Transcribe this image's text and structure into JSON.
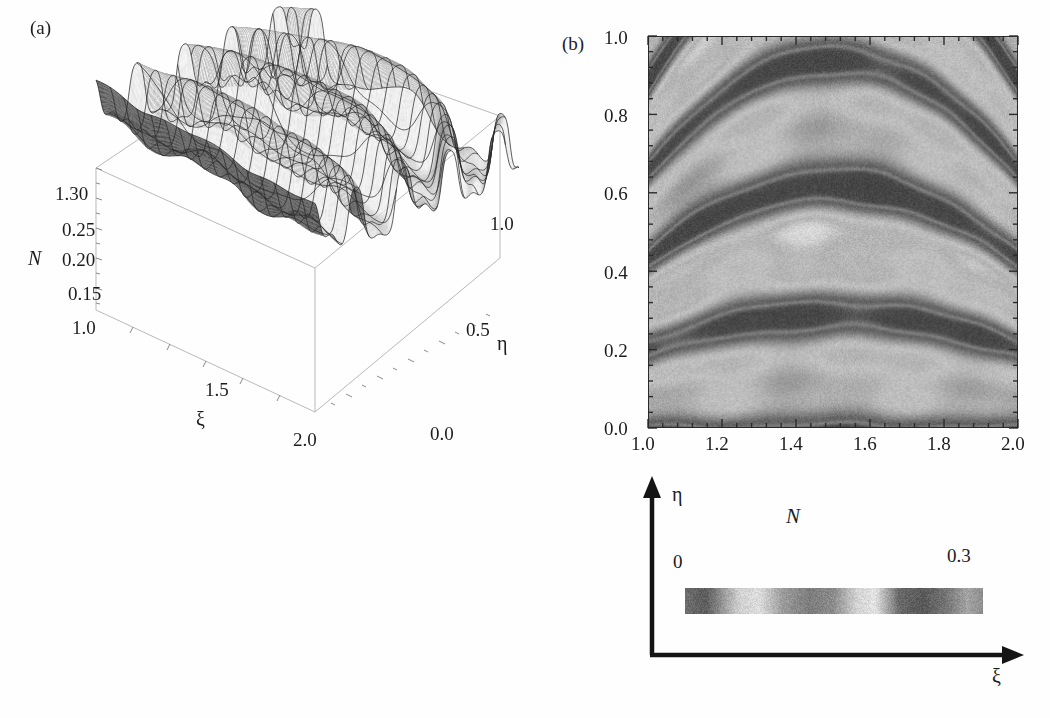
{
  "figure": {
    "panel_a_tag": "(a)",
    "panel_b_tag": "(b)"
  },
  "panel_a": {
    "type": "surface3d",
    "vertical_axis_label": "N",
    "vertical_ticks": [
      "1.30",
      "0.25",
      "0.20",
      "0.15"
    ],
    "xi_axis_label": "ξ",
    "xi_ticks": [
      "1.0",
      "1.5",
      "2.0"
    ],
    "eta_axis_label": "η",
    "eta_ticks": [
      "0.0",
      "0.5",
      "1.0"
    ],
    "mesh": true,
    "shading": "grayscale"
  },
  "panel_b": {
    "type": "density",
    "x_ticks": [
      "1.0",
      "1.2",
      "1.4",
      "1.6",
      "1.8",
      "2.0"
    ],
    "y_ticks": [
      "1.0",
      "0.8",
      "0.6",
      "0.4",
      "0.2",
      "0.0"
    ],
    "xlim": [
      1.0,
      2.0
    ],
    "ylim": [
      0.0,
      1.0
    ],
    "minor_ticks_per_interval": 4,
    "frame": true
  },
  "legend": {
    "title": "N",
    "min_label": "0",
    "max_label": "0.3",
    "eta_label": "η",
    "xi_label": "ξ",
    "axis_color": "#141414"
  },
  "chart_data": {
    "type": "heatmap",
    "title": "",
    "subtitle": "",
    "xlabel": "ξ",
    "ylabel": "η",
    "zlabel": "N",
    "x": [
      1.0,
      1.2,
      1.4,
      1.6,
      1.8,
      2.0
    ],
    "y": [
      0.0,
      0.2,
      0.4,
      0.6,
      0.8,
      1.0
    ],
    "xlim": [
      1.0,
      2.0
    ],
    "ylim": [
      0.0,
      1.0
    ],
    "zlim": [
      0,
      0.3
    ],
    "grid": false,
    "legend_position": "below",
    "colormap": "cyclic-grayscale",
    "panels": [
      {
        "id": "a",
        "tag": "(a)",
        "type": "surface",
        "axes": {
          "xi": {
            "label": "ξ",
            "ticks": [
              1.0,
              1.5,
              2.0
            ],
            "tick_labels": [
              "1.0",
              "1.5",
              "2.0"
            ]
          },
          "eta": {
            "label": "η",
            "ticks": [
              0.0,
              0.5,
              1.0
            ],
            "tick_labels": [
              "0.0",
              "0.5",
              "1.0"
            ]
          },
          "N": {
            "label": "N",
            "ticks": [
              0.15,
              0.2,
              0.25,
              0.3
            ],
            "tick_labels": [
              "0.15",
              "0.20",
              "0.25",
              "1.30"
            ]
          }
        }
      },
      {
        "id": "b",
        "tag": "(b)",
        "type": "density",
        "axes": {
          "x": {
            "label": "ξ",
            "ticks": [
              1.0,
              1.2,
              1.4,
              1.6,
              1.8,
              2.0
            ],
            "tick_labels": [
              "1.0",
              "1.2",
              "1.4",
              "1.6",
              "1.8",
              "2.0"
            ]
          },
          "y": {
            "label": "η",
            "ticks": [
              0.0,
              0.2,
              0.4,
              0.6,
              0.8,
              1.0
            ],
            "tick_labels": [
              "0.0",
              "0.2",
              "0.4",
              "0.6",
              "0.8",
              "1.0"
            ]
          }
        }
      }
    ],
    "bands": [
      {
        "center_eta": 0.94,
        "description": "bright elliptical ring around dark core, spanning xi 1.25-1.75"
      },
      {
        "center_eta": 0.7,
        "description": "bright arc crest over dark band"
      },
      {
        "center_eta": 0.55,
        "description": "broad dark arc band"
      },
      {
        "center_eta": 0.45,
        "description": "bright arc"
      },
      {
        "center_eta": 0.27,
        "description": "bright arc"
      },
      {
        "center_eta": 0.18,
        "description": "dark arc"
      },
      {
        "center_eta": 0.12,
        "description": "bright arc"
      },
      {
        "center_eta": 0.05,
        "description": "dark lobes near bottom"
      }
    ],
    "colorbar_stops": [
      {
        "pos": 0.0,
        "value": 0.0,
        "gray": "#6d6d6d"
      },
      {
        "pos": 0.07,
        "value": 0.021,
        "gray": "#5e5e5e"
      },
      {
        "pos": 0.18,
        "value": 0.054,
        "gray": "#cfcfcf"
      },
      {
        "pos": 0.25,
        "value": 0.075,
        "gray": "#dedede"
      },
      {
        "pos": 0.33,
        "value": 0.099,
        "gray": "#9a9a9a"
      },
      {
        "pos": 0.42,
        "value": 0.126,
        "gray": "#7d7d7d"
      },
      {
        "pos": 0.5,
        "value": 0.15,
        "gray": "#8d8d8d"
      },
      {
        "pos": 0.58,
        "value": 0.174,
        "gray": "#d5d5d5"
      },
      {
        "pos": 0.64,
        "value": 0.192,
        "gray": "#e2e2e2"
      },
      {
        "pos": 0.72,
        "value": 0.216,
        "gray": "#6a6a6a"
      },
      {
        "pos": 0.8,
        "value": 0.24,
        "gray": "#585858"
      },
      {
        "pos": 0.88,
        "value": 0.264,
        "gray": "#777777"
      },
      {
        "pos": 0.95,
        "value": 0.285,
        "gray": "#a5a5a5"
      },
      {
        "pos": 1.0,
        "value": 0.3,
        "gray": "#8e8e8e"
      }
    ]
  }
}
